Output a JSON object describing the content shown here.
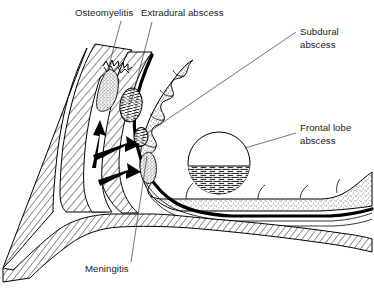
{
  "figure": {
    "background_color": "#ffffff",
    "ink_color": "#000000",
    "leader_color": "#3a3a3a",
    "width": 374,
    "height": 290
  },
  "labels": [
    {
      "id": "osteomyelitis",
      "text": "Osteomyelitis",
      "x": 75,
      "y": 16,
      "anchor": "start",
      "leader": "M 121,21 L 108,69",
      "target": "frontal-bone-destruction"
    },
    {
      "id": "extradural-abscess",
      "text": "Extradural abscess",
      "x": 141,
      "y": 16,
      "anchor": "start",
      "leader": "M 152,22 L 131,103",
      "target": "extradural-abscess-shape"
    },
    {
      "id": "subdural-abscess",
      "text": "Subdural",
      "text2": "abscess",
      "x": 300,
      "y": 35,
      "anchor": "start",
      "leader": "M 296,32 L 143,136",
      "target": "subdural-abscess-shape"
    },
    {
      "id": "frontal-lobe-abscess",
      "text": "Frontal lobe",
      "text2": "abscess",
      "x": 300,
      "y": 131,
      "anchor": "start",
      "leader": "M 296,133 L 245,148",
      "target": "frontal-lobe-abscess-shape"
    },
    {
      "id": "meningitis",
      "text": "Meningitis",
      "x": 85,
      "y": 272,
      "anchor": "start",
      "leader": "M 131,262 L 147,156",
      "target": "meningitis-shape"
    }
  ],
  "structures": [
    {
      "id": "frontal-bone",
      "name": "frontal-bone",
      "fill": "hatch"
    },
    {
      "id": "frontal-sinus",
      "name": "frontal-sinus-cavity",
      "fill": "none"
    },
    {
      "id": "bone-destruction",
      "name": "osteomyelitic-bone",
      "fill": "stipple"
    },
    {
      "id": "extradural-abscess-shape",
      "name": "extradural-abscess",
      "fill": "fluid-lines"
    },
    {
      "id": "subdural-abscess-shape",
      "name": "subdural-abscess",
      "fill": "fluid-lines"
    },
    {
      "id": "meningitis-shape",
      "name": "meningitis-exudate",
      "fill": "stipple"
    },
    {
      "id": "frontal-lobe-abscess-shape",
      "name": "frontal-lobe-abscess",
      "fill": "fluid-level"
    },
    {
      "id": "brain",
      "name": "frontal-lobe-cortex",
      "fill": "stipple"
    },
    {
      "id": "dura",
      "name": "dura-mater",
      "fill": "thick-black-line"
    },
    {
      "id": "arrows",
      "name": "infection-spread-arrows",
      "fill": "solid-black"
    },
    {
      "id": "nasal-bone",
      "name": "nasal-bone",
      "fill": "hatch"
    },
    {
      "id": "skull-base",
      "name": "anterior-cranial-fossa-floor",
      "fill": "hatch"
    }
  ]
}
